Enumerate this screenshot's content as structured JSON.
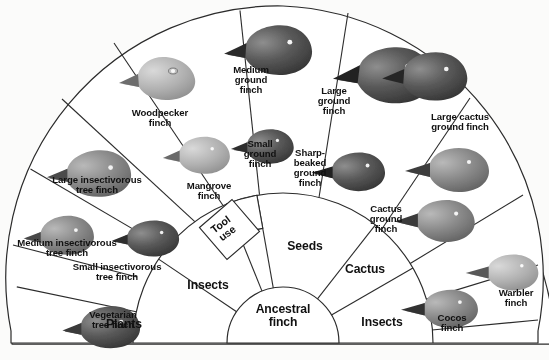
{
  "figure": {
    "type": "radial-fan-diagram",
    "center": {
      "label": "Ancestral\nfinch"
    }
  },
  "diet_ring": [
    {
      "id": "plants",
      "label": "Plants",
      "cx": 124,
      "cy": 326
    },
    {
      "id": "insects_left",
      "label": "Insects",
      "cx": 208,
      "cy": 287
    },
    {
      "id": "tool_use",
      "label": "Tool\nuse",
      "cx": 224,
      "cy": 233,
      "rotate": -36
    },
    {
      "id": "seeds",
      "label": "Seeds",
      "cx": 305,
      "cy": 248
    },
    {
      "id": "cactus",
      "label": "Cactus",
      "cx": 365,
      "cy": 271
    },
    {
      "id": "insects_right",
      "label": "Insects",
      "cx": 382,
      "cy": 324
    }
  ],
  "species_ring": [
    {
      "id": "vegetarian-tree-finch",
      "label": "Vegetarian\ntree finch",
      "cx": 113,
      "cy": 320
    },
    {
      "id": "small-insectivorous-tree-finch",
      "label": "Small insectivorous\ntree finch",
      "cx": 117,
      "cy": 272
    },
    {
      "id": "medium-insectivorous-tree-finch",
      "label": "Medium insectivorous\ntree finch",
      "cx": 67,
      "cy": 248
    },
    {
      "id": "large-insectivorous-tree-finch",
      "label": "Large insectivorous\ntree finch",
      "cx": 97,
      "cy": 185
    },
    {
      "id": "woodpecker-finch",
      "label": "Woodpecker\nfinch",
      "cx": 160,
      "cy": 118
    },
    {
      "id": "mangrove-finch",
      "label": "Mangrove\nfinch",
      "cx": 209,
      "cy": 191
    },
    {
      "id": "medium-ground-finch",
      "label": "Medium\nground\nfinch",
      "cx": 251,
      "cy": 85
    },
    {
      "id": "small-ground-finch",
      "label": "Small\nground\nfinch",
      "cx": 260,
      "cy": 159
    },
    {
      "id": "large-ground-finch",
      "label": "Large\nground\nfinch",
      "cx": 334,
      "cy": 106
    },
    {
      "id": "sharp-beaked-ground-finch",
      "label": "Sharp-\nbeaked\nground\nfinch",
      "cx": 310,
      "cy": 174
    },
    {
      "id": "large-cactus-ground-finch",
      "label": "Large cactus\nground finch",
      "cx": 460,
      "cy": 129
    },
    {
      "id": "cactus-ground-finch",
      "label": "Cactus\nground\nfinch",
      "cx": 386,
      "cy": 222
    },
    {
      "id": "cocos-finch",
      "label": "Cocos\nfinch",
      "cx": 452,
      "cy": 326
    },
    {
      "id": "warbler-finch",
      "label": "Warbler\nfinch",
      "cx": 516,
      "cy": 303
    }
  ],
  "colors": {
    "ink": "#111111",
    "line": "#2b2b2b",
    "paper": "#fbfbfa",
    "bird_dark": "#4a4a4a",
    "bird_mid": "#7d7d7d",
    "bird_light": "#b3b3b3"
  }
}
